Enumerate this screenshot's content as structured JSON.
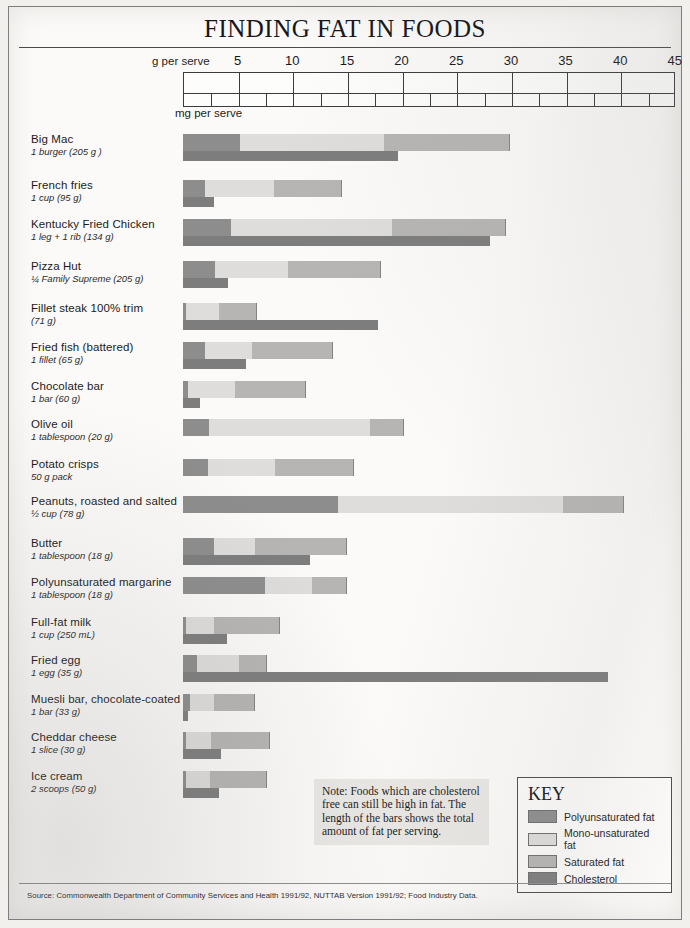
{
  "title": "FINDING FAT IN FOODS",
  "axis": {
    "g_label": "g per serve",
    "mg_label": "mg per serve",
    "ticks": [
      5,
      10,
      15,
      20,
      25,
      30,
      35,
      40,
      45
    ]
  },
  "note": "Note: Foods which are cholesterol free can still be high in fat. The length of the bars shows the total amount of fat per serving.",
  "key": {
    "title": "KEY",
    "items": [
      {
        "label": "Polyunsaturated fat",
        "color": "#8d8d8d"
      },
      {
        "label": "Mono-unsaturated fat",
        "color": "#dedddb"
      },
      {
        "label": "Saturated fat",
        "color": "#b6b5b3"
      },
      {
        "label": "Cholesterol",
        "color": "#7d7d7d"
      }
    ]
  },
  "source": "Source: Commonwealth Department of Community Services and Health 1991/92, NUTTAB Version 1991/92; Food Industry Data.",
  "colors": {
    "poly": "#8d8d8d",
    "mono": "#dedddb",
    "sat": "#b6b5b3",
    "chol": "#7d7d7d"
  },
  "chart_data": {
    "type": "bar",
    "title": "FINDING FAT IN FOODS",
    "xlabel": "g per serve",
    "ylabel": "",
    "xlim": [
      0,
      45
    ],
    "grid": false,
    "legend_position": "bottom-right",
    "stacked": true,
    "note": "Bars are stacked: polyunsaturated + mono-unsaturated + saturated fat = total fat per serve. A separate lower bar shows cholesterol (mg per serve, second scale).",
    "series": [
      {
        "name": "Polyunsaturated fat",
        "color": "#8d8d8d"
      },
      {
        "name": "Mono-unsaturated fat",
        "color": "#dedddb"
      },
      {
        "name": "Saturated fat",
        "color": "#b6b5b3"
      },
      {
        "name": "Cholesterol",
        "color": "#7d7d7d"
      }
    ],
    "categories": [
      "Big Mac",
      "French fries",
      "Kentucky Fried Chicken",
      "Pizza Hut",
      "Fillet steak 100% trim",
      "Fried fish (battered)",
      "Chocolate bar",
      "Olive oil",
      "Potato crisps",
      "Peanuts, roasted and salted",
      "Butter",
      "Polyunsaturated margarine",
      "Full-fat milk",
      "Fried egg",
      "Muesli bar, chocolate-coated",
      "Cheddar cheese",
      "Ice cream"
    ],
    "rows": [
      {
        "name": "Big Mac",
        "serve": "1 burger (205 g )",
        "poly": 5.2,
        "mono": 13.2,
        "sat": 11.4,
        "total": 29.8,
        "chol": 19.7
      },
      {
        "name": "French fries",
        "serve": "1 cup (95 g)",
        "poly": 2.0,
        "mono": 6.3,
        "sat": 6.2,
        "total": 14.5,
        "chol": 2.8
      },
      {
        "name": "Kentucky Fried Chicken",
        "serve": "1 leg + 1 rib (134 g)",
        "poly": 4.4,
        "mono": 14.7,
        "sat": 10.4,
        "total": 29.5,
        "chol": 28.1
      },
      {
        "name": "Pizza Hut",
        "serve": "¼ Family Supreme (205 g)",
        "poly": 2.9,
        "mono": 6.7,
        "sat": 8.4,
        "total": 18.0,
        "chol": 4.1
      },
      {
        "name": "Fillet steak 100% trim",
        "serve": "(71 g)",
        "poly": 0.3,
        "mono": 3.0,
        "sat": 3.4,
        "total": 6.7,
        "chol": 17.8
      },
      {
        "name": "Fried fish (battered)",
        "serve": "1 fillet (65 g)",
        "poly": 2.0,
        "mono": 4.3,
        "sat": 7.3,
        "total": 13.6,
        "chol": 5.8
      },
      {
        "name": "Chocolate bar",
        "serve": "1 bar (60 g)",
        "poly": 0.5,
        "mono": 4.3,
        "sat": 6.4,
        "total": 11.2,
        "chol": 1.6
      },
      {
        "name": "Olive oil",
        "serve": "1 tablespoon (20 g)",
        "poly": 2.4,
        "mono": 14.7,
        "sat": 3.0,
        "total": 20.1,
        "chol": 0
      },
      {
        "name": "Potato crisps",
        "serve": "50 g pack",
        "poly": 2.3,
        "mono": 6.1,
        "sat": 7.2,
        "total": 15.6,
        "chol": 0
      },
      {
        "name": "Peanuts, roasted and salted",
        "serve": "½ cup (78 g)",
        "poly": 14.2,
        "mono": 20.6,
        "sat": 5.5,
        "total": 40.3,
        "chol": 0
      },
      {
        "name": "Butter",
        "serve": "1 tablespoon (18 g)",
        "poly": 2.8,
        "mono": 3.8,
        "sat": 8.3,
        "total": 14.9,
        "chol": 11.6
      },
      {
        "name": "Polyunsaturated margarine",
        "serve": "1 tablespoon (18 g)",
        "poly": 7.5,
        "mono": 4.3,
        "sat": 3.1,
        "total": 14.9,
        "chol": 0
      },
      {
        "name": "Full-fat milk",
        "serve": "1 cup (250 mL)",
        "poly": 0.3,
        "mono": 2.5,
        "sat": 6.0,
        "total": 8.8,
        "chol": 4.0
      },
      {
        "name": "Fried egg",
        "serve": "1 egg (35 g)",
        "poly": 1.3,
        "mono": 3.8,
        "sat": 2.5,
        "total": 7.6,
        "chol": 38.9
      },
      {
        "name": "Muesli bar, chocolate-coated",
        "serve": "1 bar (33 g)",
        "poly": 0.6,
        "mono": 2.2,
        "sat": 3.7,
        "total": 6.5,
        "chol": 0.5
      },
      {
        "name": "Cheddar cheese",
        "serve": "1 slice (30 g)",
        "poly": 0.3,
        "mono": 2.3,
        "sat": 5.3,
        "total": 7.9,
        "chol": 3.5
      },
      {
        "name": "Ice cream",
        "serve": "2 scoops (50 g)",
        "poly": 0.3,
        "mono": 2.2,
        "sat": 5.1,
        "total": 7.6,
        "chol": 3.3
      }
    ]
  }
}
